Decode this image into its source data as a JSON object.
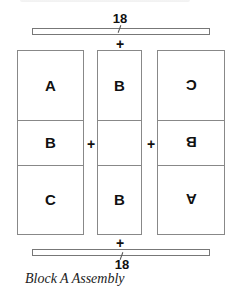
{
  "figure": {
    "caption": "Block A Assembly",
    "top_strip": {
      "dimension_label": "18"
    },
    "bottom_strip": {
      "dimension_label": "18"
    },
    "join_symbol": "+",
    "columns": [
      {
        "position": "left",
        "cells": [
          {
            "label": "A",
            "orientation": "normal"
          },
          {
            "label": "B",
            "orientation": "normal"
          },
          {
            "label": "C",
            "orientation": "normal"
          }
        ]
      },
      {
        "position": "center",
        "cells": [
          {
            "label": "B",
            "orientation": "normal"
          },
          {
            "label": "",
            "orientation": "normal"
          },
          {
            "label": "B",
            "orientation": "normal"
          }
        ]
      },
      {
        "position": "right",
        "cells": [
          {
            "label": "C",
            "orientation": "rotated-180"
          },
          {
            "label": "B",
            "orientation": "rotated-180"
          },
          {
            "label": "A",
            "orientation": "rotated-180"
          }
        ]
      }
    ]
  }
}
